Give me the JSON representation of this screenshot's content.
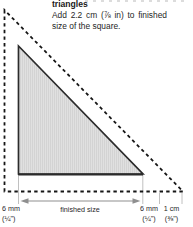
{
  "header": {
    "title": "triangles",
    "instruction_line1": "Add 2.2 cm (⅞ in) to finished",
    "instruction_line2": "size of the square."
  },
  "diagram": {
    "type": "quilt-triangle-cutting-diagram",
    "shapes": {
      "finished_triangle": "right triangle, shaded, solid outline",
      "cutting_outline": "larger right triangle, dashed outline (seam allowance added)"
    },
    "labels": {
      "left_seam_metric": "6 mm",
      "left_seam_imperial": "(¼\")",
      "finished_size": "finished size",
      "right_seam_metric": "6 mm",
      "right_seam_imperial": "(¼\")",
      "corner_metric": "1 cm",
      "corner_imperial": "(⅜\")"
    },
    "colors": {
      "dashed_line": "#161616",
      "triangle_stroke": "#2b2b2b",
      "triangle_fill": "#dedede",
      "guide_line": "#b0b0b0",
      "arrow": "#8f8f8f",
      "text": "#1f1f1f"
    }
  }
}
